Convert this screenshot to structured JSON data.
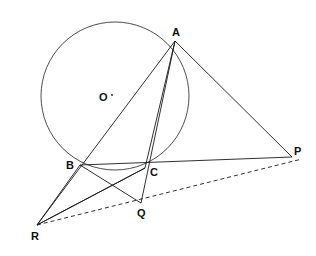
{
  "figure": {
    "type": "euclidean-geometry-diagram",
    "width": 316,
    "height": 256,
    "background_color": "#ffffff",
    "stroke_color": "#1a1a1a",
    "label_color": "#111111"
  },
  "circle": {
    "name": "circumcircle",
    "center_label": "O",
    "center_x": 115,
    "center_y": 96,
    "radius": 74,
    "stroke": "#3a3a3a",
    "stroke_width": 0.9,
    "fill": "none"
  },
  "points": [
    {
      "id": "A",
      "label": "A",
      "x": 175,
      "y": 41,
      "label_x": 172,
      "label_y": 27,
      "on_circle": true
    },
    {
      "id": "B",
      "label": "B",
      "x": 80,
      "y": 165,
      "label_x": 66,
      "label_y": 160,
      "on_circle": true
    },
    {
      "id": "C",
      "label": "C",
      "x": 145,
      "y": 168,
      "label_x": 150,
      "label_y": 167,
      "on_circle": true
    },
    {
      "id": "O",
      "label": "O",
      "x": 115,
      "y": 96,
      "label_x": 99,
      "label_y": 92,
      "on_circle": false
    },
    {
      "id": "P",
      "label": "P",
      "x": 292,
      "y": 157,
      "label_x": 294,
      "label_y": 146,
      "on_circle": false
    },
    {
      "id": "Q",
      "label": "Q",
      "x": 141,
      "y": 203,
      "label_x": 137,
      "label_y": 208,
      "on_circle": false
    },
    {
      "id": "R",
      "label": "R",
      "x": 37,
      "y": 225,
      "label_x": 31,
      "label_y": 231,
      "on_circle": false
    }
  ],
  "segments": [
    {
      "name": "segment-R-to-A-through-B",
      "from": "R",
      "to": "A",
      "x1": 37,
      "y1": 225,
      "x2": 175,
      "y2": 41,
      "style": "solid",
      "stroke_width": 0.9
    },
    {
      "name": "segment-R-to-A-through-C",
      "from": "R",
      "to": "A",
      "x1": 37,
      "y1": 225,
      "x2": 175,
      "y2": 41,
      "style": "solid",
      "stroke_width": 0.9,
      "via_x": 145,
      "via_y": 168
    },
    {
      "name": "segment-A-to-P",
      "from": "A",
      "to": "P",
      "x1": 175,
      "y1": 41,
      "x2": 292,
      "y2": 157,
      "style": "solid",
      "stroke_width": 0.9
    },
    {
      "name": "segment-B-to-P-through-C",
      "from": "B",
      "to": "P",
      "x1": 80,
      "y1": 165,
      "x2": 292,
      "y2": 157,
      "style": "solid",
      "stroke_width": 0.9
    },
    {
      "name": "segment-A-to-Q-through-C",
      "from": "A",
      "to": "Q",
      "x1": 175,
      "y1": 41,
      "x2": 141,
      "y2": 203,
      "style": "solid",
      "stroke_width": 0.9
    },
    {
      "name": "segment-B-to-Q",
      "from": "B",
      "to": "Q",
      "x1": 80,
      "y1": 165,
      "x2": 141,
      "y2": 203,
      "style": "solid",
      "stroke_width": 0.9
    },
    {
      "name": "segment-C-to-R",
      "from": "C",
      "to": "R",
      "x1": 145,
      "y1": 168,
      "x2": 37,
      "y2": 225,
      "style": "solid",
      "stroke_width": 0.9
    },
    {
      "name": "segment-B-to-R",
      "from": "B",
      "to": "R",
      "x1": 80,
      "y1": 165,
      "x2": 37,
      "y2": 225,
      "style": "solid",
      "stroke_width": 0.9
    },
    {
      "name": "segment-R-to-P-through-Q-dashed",
      "from": "R",
      "to": "P",
      "x1": 37,
      "y1": 225,
      "x2": 302,
      "y2": 159,
      "style": "dashed",
      "stroke_width": 0.9,
      "dash_pattern": "4 3"
    }
  ],
  "center_dot": {
    "name": "center-mark",
    "x": 112,
    "y": 95,
    "radius": 0.9
  }
}
